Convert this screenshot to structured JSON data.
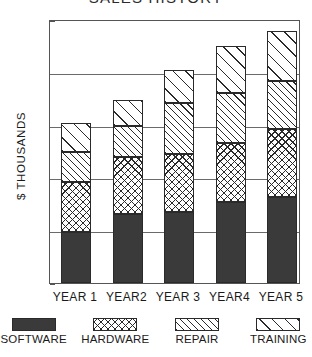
{
  "chart_data": {
    "type": "bar",
    "subtype": "stacked-vertical",
    "title": "SALES HISTORY",
    "xlabel": "",
    "ylabel": "$ THOUSANDS",
    "ylim": [
      0,
      250
    ],
    "yticks": [
      0,
      50,
      100,
      150,
      200,
      250
    ],
    "grid": true,
    "legend_position": "bottom",
    "categories": [
      "YEAR 1",
      "YEAR2",
      "YEAR 3",
      "YEAR4",
      "YEAR 5"
    ],
    "series": [
      {
        "name": "SOFTWARE",
        "pattern": "solid",
        "values": [
          48,
          65,
          67,
          77,
          81
        ]
      },
      {
        "name": "HARDWARE",
        "pattern": "crosshatch",
        "values": [
          48,
          54,
          55,
          56,
          65
        ]
      },
      {
        "name": "REPAIR",
        "pattern": "diagonal-dense",
        "values": [
          28,
          30,
          48,
          47,
          45
        ]
      },
      {
        "name": "TRAINING",
        "pattern": "diagonal-wide",
        "values": [
          28,
          24,
          32,
          44,
          48
        ]
      }
    ],
    "totals": [
      152,
      173,
      202,
      224,
      239
    ],
    "cumulative_tops": [
      [
        48,
        96,
        124,
        152
      ],
      [
        65,
        119,
        149,
        173
      ],
      [
        67,
        122,
        170,
        202
      ],
      [
        77,
        133,
        180,
        224
      ],
      [
        81,
        146,
        191,
        239
      ]
    ]
  },
  "legend": {
    "items": [
      {
        "label": "SOFTWARE"
      },
      {
        "label": "HARDWARE"
      },
      {
        "label": "REPAIR"
      },
      {
        "label": "TRAINING"
      }
    ]
  }
}
